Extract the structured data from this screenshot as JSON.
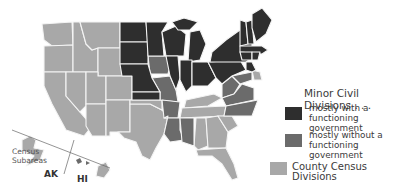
{
  "legend": {
    "title": "Minor Civil Divisions . . .",
    "items": [
      {
        "label_line1": "mostly with a",
        "label_line2": "functioning government",
        "color": "#2e2e2e"
      },
      {
        "label_line1": "mostly without a",
        "label_line2": "functioning government",
        "color": "#6b6b6b"
      },
      {
        "label_line1": "County Census Divisions",
        "label_line2": "",
        "color": "#a8a8a8"
      }
    ]
  },
  "inset": {
    "census_subareas_line1": "Census",
    "census_subareas_line2": "Subareas",
    "alaska": "AK",
    "hawaii": "HI"
  },
  "colors": {
    "dark": "#2e2e2e",
    "medium": "#6b6b6b",
    "light": "#a8a8a8",
    "border": "#f4f4f4"
  }
}
